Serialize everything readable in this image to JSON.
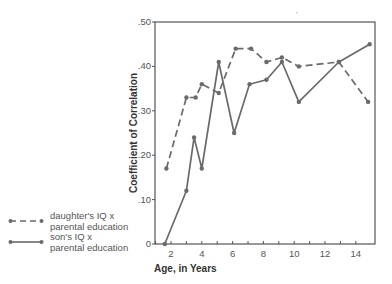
{
  "chart_data": {
    "type": "line",
    "title": "",
    "xlabel": "Age, in Years",
    "ylabel": "Coefficient of Correlation",
    "xlim": [
      1,
      15
    ],
    "ylim": [
      0,
      0.5
    ],
    "x_ticks": [
      2,
      4,
      6,
      8,
      10,
      12,
      14
    ],
    "x_tick_labels": [
      "2",
      "4",
      "6",
      "8",
      "10",
      "12",
      "14"
    ],
    "y_ticks": [
      0,
      0.1,
      0.2,
      0.3,
      0.4,
      0.5
    ],
    "y_tick_labels": [
      "0",
      ".10",
      ".20",
      ".30",
      ".40",
      ".50"
    ],
    "grid": false,
    "legend_position": "left, outside plot",
    "series": [
      {
        "name": "daughter's IQ x parental education",
        "style": "dashed",
        "points": [
          [
            1.7,
            0.17
          ],
          [
            3.0,
            0.33
          ],
          [
            3.6,
            0.33
          ],
          [
            4.0,
            0.36
          ],
          [
            5.1,
            0.34
          ],
          [
            6.2,
            0.44
          ],
          [
            7.2,
            0.44
          ],
          [
            8.2,
            0.41
          ],
          [
            9.2,
            0.42
          ],
          [
            10.3,
            0.4
          ],
          [
            12.9,
            0.41
          ],
          [
            14.8,
            0.32
          ]
        ]
      },
      {
        "name": "son's IQ x parental education",
        "style": "solid",
        "points": [
          [
            1.6,
            0.0
          ],
          [
            3.0,
            0.12
          ],
          [
            3.5,
            0.24
          ],
          [
            4.0,
            0.17
          ],
          [
            5.1,
            0.41
          ],
          [
            6.1,
            0.25
          ],
          [
            7.1,
            0.36
          ],
          [
            8.2,
            0.37
          ],
          [
            9.2,
            0.41
          ],
          [
            10.3,
            0.32
          ],
          [
            12.9,
            0.41
          ],
          [
            14.9,
            0.45
          ]
        ]
      }
    ]
  },
  "legend": {
    "items": [
      {
        "line1": "daughter's IQ x",
        "line2": "parental education"
      },
      {
        "line1": "son's IQ x",
        "line2": "parental education"
      }
    ]
  },
  "colors": {
    "line": "#6a6a6a",
    "axis": "#555555"
  }
}
